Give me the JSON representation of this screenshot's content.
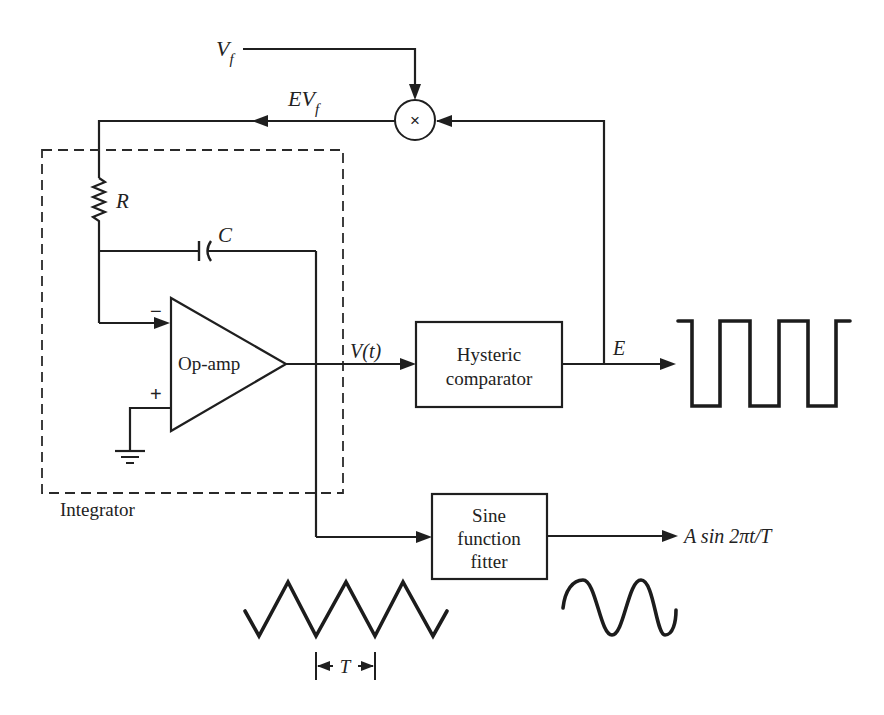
{
  "diagram": {
    "type": "block-circuit",
    "colors": {
      "ink": "#1f1f1f",
      "background": "#ffffff"
    },
    "inputs": {
      "vf_label": "V",
      "vf_sub": "f"
    },
    "multiplier": {
      "symbol": "×",
      "output_label_main": "EV",
      "output_label_sub": "f"
    },
    "integrator": {
      "label": "Integrator",
      "resistor_label": "R",
      "capacitor_label": "C",
      "opamp_label": "Op-amp",
      "inverting_sign": "−",
      "noninverting_sign": "+"
    },
    "signals": {
      "vt_label": "V(t)",
      "e_label": "E",
      "output_label": "A sin 2πt/T",
      "period_label": "T"
    },
    "blocks": [
      {
        "id": "hysteric-comparator",
        "lines": [
          "Hysteric",
          "comparator"
        ]
      },
      {
        "id": "sine-function-fitter",
        "lines": [
          "Sine",
          "function",
          "fitter"
        ]
      }
    ],
    "waveforms": [
      {
        "id": "square-wave",
        "kind": "square",
        "periods": 3
      },
      {
        "id": "triangle-wave",
        "kind": "triangle",
        "periods": 3.5
      },
      {
        "id": "sine-wave",
        "kind": "sine",
        "periods": 2
      }
    ]
  }
}
